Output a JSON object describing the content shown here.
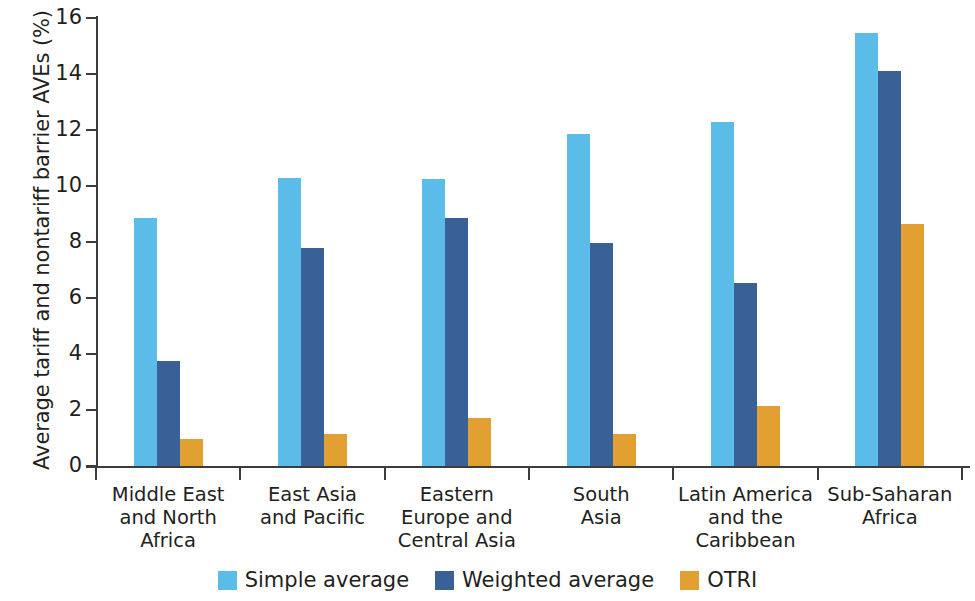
{
  "chart_data": {
    "type": "bar",
    "title": "",
    "xlabel": "",
    "ylabel": "Average tariff and nontariff barrier AVEs (%)",
    "ylim": [
      0,
      16
    ],
    "ytick_step": 2,
    "yticks": [
      0,
      2,
      4,
      6,
      8,
      10,
      12,
      14,
      16
    ],
    "ytick_labels": [
      "0",
      "2",
      "4",
      "6",
      "8",
      "10",
      "12",
      "14",
      "16"
    ],
    "grid": false,
    "legend_position": "bottom-center",
    "categories": [
      "Middle East and North Africa",
      "East Asia and Pacific",
      "Eastern Europe and Central Asia",
      "South Asia",
      "Latin America and the Caribbean",
      "Sub-Saharan Africa"
    ],
    "category_lines": [
      [
        "Middle East",
        "and North",
        "Africa"
      ],
      [
        "East Asia",
        "and Pacific"
      ],
      [
        "Eastern",
        "Europe and",
        "Central Asia"
      ],
      [
        "South",
        "Asia"
      ],
      [
        "Latin America",
        "and the",
        "Caribbean"
      ],
      [
        "Sub-Saharan",
        "Africa"
      ]
    ],
    "series": [
      {
        "name": "Simple average",
        "key": "simple",
        "color": "#5bbce9",
        "values": [
          8.85,
          10.3,
          10.25,
          11.85,
          12.3,
          15.45
        ]
      },
      {
        "name": "Weighted average",
        "key": "weighted",
        "color": "#3a6098",
        "values": [
          3.75,
          7.8,
          8.85,
          7.95,
          6.55,
          14.1
        ]
      },
      {
        "name": "OTRI",
        "key": "otri",
        "color": "#e2a033",
        "values": [
          0.95,
          1.15,
          1.7,
          1.15,
          2.15,
          8.65
        ]
      }
    ]
  },
  "legend": {
    "items": [
      {
        "label": "Simple average",
        "key": "simple"
      },
      {
        "label": "Weighted average",
        "key": "weighted"
      },
      {
        "label": "OTRI",
        "key": "otri"
      }
    ]
  },
  "colors": {
    "simple_average": "#5bbce9",
    "weighted_average": "#3a6098",
    "otri": "#e2a033",
    "axis": "#3c3c3c",
    "text": "#231f20",
    "background": "#ffffff"
  }
}
